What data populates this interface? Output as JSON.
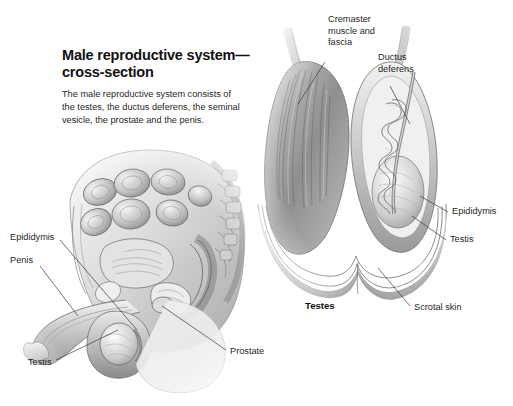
{
  "figure": {
    "title": "Male reproductive\nsystem—cross-section",
    "intro": "The male reproductive system consists of the testes, the ductus deferens, the seminal vesicle, the prostate and the penis.",
    "caption": "Testes",
    "text_color": "#1f1f1f",
    "background": "#ffffff",
    "leader_color": "#3a3a3a"
  },
  "labels": {
    "left_figure": [
      {
        "id": "epididymis-left",
        "text": "Epididymis"
      },
      {
        "id": "penis",
        "text": "Penis"
      },
      {
        "id": "testis-left",
        "text": "Testis"
      },
      {
        "id": "prostate",
        "text": "Prostate"
      }
    ],
    "right_figure": [
      {
        "id": "cremaster",
        "text": "Cremaster\nmuscle and\nfascia"
      },
      {
        "id": "ductus-deferens",
        "text": "Ductus\ndeferens"
      },
      {
        "id": "epididymis-right",
        "text": "Epididymis"
      },
      {
        "id": "testis-right",
        "text": "Testis"
      },
      {
        "id": "scrotal-skin",
        "text": "Scrotal skin"
      }
    ]
  }
}
